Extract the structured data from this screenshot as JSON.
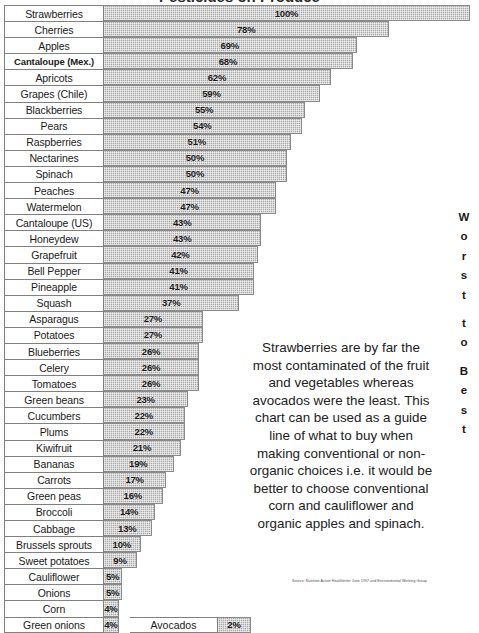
{
  "title": "Pesticides on Produce",
  "axis_label_worst_to_best": [
    "W",
    "o",
    "r",
    "s",
    "t",
    "",
    "t",
    "o",
    "",
    "B",
    "e",
    "s",
    "t"
  ],
  "annotation": "Strawberries are by far the most contaminated of the fruit and vegetables whereas avocados were the least.  This chart can be used as a guide line of what to buy when making conventional or non-organic choices i.e. it would be better to choose conventional corn and cauliflower and organic apples and spinach.",
  "source": "Source: Nutrition Action Healthletter June 1997 and Environmental Working Group",
  "avocado": {
    "label": "Avocados",
    "pct_label": "2%",
    "value": 2
  },
  "colors": {
    "bar_fill": "#a8a8a8",
    "bar_border": "#8a8a8a",
    "cell_border": "#808080",
    "text": "#1a1a1a"
  },
  "chart_data": {
    "type": "bar",
    "title": "Pesticides on Produce",
    "xlabel": "",
    "ylabel": "",
    "orientation": "horizontal",
    "xlim": [
      0,
      100
    ],
    "grid": false,
    "legend": null,
    "categories": [
      "Strawberries",
      "Cherries",
      "Apples",
      "Cantaloupe (Mex.)",
      "Apricots",
      "Grapes (Chile)",
      "Blackberries",
      "Pears",
      "Raspberries",
      "Nectarines",
      "Spinach",
      "Peaches",
      "Watermelon",
      "Cantaloupe (US)",
      "Honeydew",
      "Grapefruit",
      "Bell Pepper",
      "Pineapple",
      "Squash",
      "Asparagus",
      "Potatoes",
      "Blueberries",
      "Celery",
      "Tomatoes",
      "Green beans",
      "Cucumbers",
      "Plums",
      "Kiwifruit",
      "Bananas",
      "Carrots",
      "Green peas",
      "Broccoli",
      "Cabbage",
      "Brussels sprouts",
      "Sweet potatoes",
      "Cauliflower",
      "Onions",
      "Corn",
      "Green onions",
      "Avocados"
    ],
    "values": [
      100,
      78,
      69,
      68,
      62,
      59,
      55,
      54,
      51,
      50,
      50,
      47,
      47,
      43,
      43,
      42,
      41,
      41,
      37,
      27,
      27,
      26,
      26,
      26,
      23,
      22,
      22,
      21,
      19,
      17,
      16,
      14,
      13,
      10,
      9,
      5,
      5,
      4,
      4,
      2
    ]
  },
  "rows": [
    {
      "label": "Strawberries",
      "pct_label": "100%",
      "value": 100,
      "bold": false
    },
    {
      "label": "Cherries",
      "pct_label": "78%",
      "value": 78,
      "bold": false
    },
    {
      "label": "Apples",
      "pct_label": "69%",
      "value": 69,
      "bold": false
    },
    {
      "label": "Cantaloupe (Mex.)",
      "pct_label": "68%",
      "value": 68,
      "bold": true
    },
    {
      "label": "Apricots",
      "pct_label": "62%",
      "value": 62,
      "bold": false
    },
    {
      "label": "Grapes (Chile)",
      "pct_label": "59%",
      "value": 59,
      "bold": false
    },
    {
      "label": "Blackberries",
      "pct_label": "55%",
      "value": 55,
      "bold": false
    },
    {
      "label": "Pears",
      "pct_label": "54%",
      "value": 54,
      "bold": false
    },
    {
      "label": "Raspberries",
      "pct_label": "51%",
      "value": 51,
      "bold": false
    },
    {
      "label": "Nectarines",
      "pct_label": "50%",
      "value": 50,
      "bold": false
    },
    {
      "label": "Spinach",
      "pct_label": "50%",
      "value": 50,
      "bold": false
    },
    {
      "label": "Peaches",
      "pct_label": "47%",
      "value": 47,
      "bold": false
    },
    {
      "label": "Watermelon",
      "pct_label": "47%",
      "value": 47,
      "bold": false
    },
    {
      "label": "Cantaloupe (US)",
      "pct_label": "43%",
      "value": 43,
      "bold": false
    },
    {
      "label": "Honeydew",
      "pct_label": "43%",
      "value": 43,
      "bold": false
    },
    {
      "label": "Grapefruit",
      "pct_label": "42%",
      "value": 42,
      "bold": false
    },
    {
      "label": "Bell Pepper",
      "pct_label": "41%",
      "value": 41,
      "bold": false
    },
    {
      "label": "Pineapple",
      "pct_label": "41%",
      "value": 41,
      "bold": false
    },
    {
      "label": "Squash",
      "pct_label": "37%",
      "value": 37,
      "bold": false
    },
    {
      "label": "Asparagus",
      "pct_label": "27%",
      "value": 27,
      "bold": false
    },
    {
      "label": "Potatoes",
      "pct_label": "27%",
      "value": 27,
      "bold": false
    },
    {
      "label": "Blueberries",
      "pct_label": "26%",
      "value": 26,
      "bold": false
    },
    {
      "label": "Celery",
      "pct_label": "26%",
      "value": 26,
      "bold": false
    },
    {
      "label": "Tomatoes",
      "pct_label": "26%",
      "value": 26,
      "bold": false
    },
    {
      "label": "Green beans",
      "pct_label": "23%",
      "value": 23,
      "bold": false
    },
    {
      "label": "Cucumbers",
      "pct_label": "22%",
      "value": 22,
      "bold": false
    },
    {
      "label": "Plums",
      "pct_label": "22%",
      "value": 22,
      "bold": false
    },
    {
      "label": "Kiwifruit",
      "pct_label": "21%",
      "value": 21,
      "bold": false
    },
    {
      "label": "Bananas",
      "pct_label": "19%",
      "value": 19,
      "bold": false
    },
    {
      "label": "Carrots",
      "pct_label": "17%",
      "value": 17,
      "bold": false
    },
    {
      "label": "Green peas",
      "pct_label": "16%",
      "value": 16,
      "bold": false
    },
    {
      "label": "Broccoli",
      "pct_label": "14%",
      "value": 14,
      "bold": false
    },
    {
      "label": "Cabbage",
      "pct_label": "13%",
      "value": 13,
      "bold": false
    },
    {
      "label": "Brussels sprouts",
      "pct_label": "10%",
      "value": 10,
      "bold": false
    },
    {
      "label": "Sweet potatoes",
      "pct_label": "9%",
      "value": 9,
      "bold": false
    },
    {
      "label": "Cauliflower",
      "pct_label": "5%",
      "value": 5,
      "bold": false
    },
    {
      "label": "Onions",
      "pct_label": "5%",
      "value": 5,
      "bold": false
    },
    {
      "label": "Corn",
      "pct_label": "4%",
      "value": 4,
      "bold": false
    },
    {
      "label": "Green onions",
      "pct_label": "4%",
      "value": 4,
      "bold": false
    }
  ]
}
